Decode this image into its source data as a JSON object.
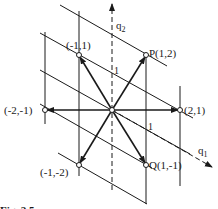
{
  "figure": {
    "caption": "Fig. 2.5",
    "axes": {
      "q1": {
        "label": "q",
        "subscript": "1",
        "unit_label": "1"
      },
      "q2": {
        "label": "q",
        "subscript": "2",
        "unit_label": "1"
      }
    },
    "points": [
      {
        "id": "origin",
        "label": ""
      },
      {
        "id": "p",
        "label": "P(1,2)"
      },
      {
        "id": "q",
        "label": "Q(1,-1)"
      },
      {
        "id": "n1p1",
        "label": "(-1,1)"
      },
      {
        "id": "p2p1",
        "label": "(2,1)"
      },
      {
        "id": "n2n1",
        "label": "(-2,-1)"
      },
      {
        "id": "n1n2",
        "label": "(-1,-2)"
      }
    ],
    "colors": {
      "ink": "#1a1a1a",
      "background": "#ffffff"
    }
  }
}
